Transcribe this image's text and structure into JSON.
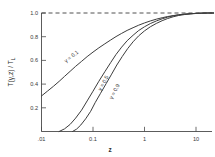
{
  "chart_data": {
    "type": "line",
    "title": "",
    "xlabel": "z",
    "ylabel": "T(γ,z) / T_L",
    "ylabel_main": "T(γ,z) / T",
    "ylabel_sub": "L",
    "xscale": "log",
    "xlim": [
      0.008,
      30
    ],
    "ylim": [
      0.0,
      1.06
    ],
    "grid": false,
    "legend_position": "inline-curve-labels",
    "xticks": [
      0.01,
      0.1,
      1,
      10
    ],
    "xticklabels": [
      ".01",
      "0.1",
      "1",
      "10"
    ],
    "yticks": [
      0.2,
      0.4,
      0.6,
      0.8,
      1.0
    ],
    "yticklabels": [
      "0.2",
      "0.4",
      "0.6",
      "0.8",
      "1.0"
    ],
    "annotations": [
      {
        "text": "γ = 0.1",
        "x": 0.04,
        "y": 0.62,
        "rotation": -38
      },
      {
        "text": "γ = 0.5",
        "x": 0.17,
        "y": 0.4,
        "rotation": -62
      },
      {
        "text": "γ = 0.9",
        "x": 0.28,
        "y": 0.33,
        "rotation": -62
      }
    ],
    "reference_line": {
      "y": 1.0,
      "style": "dashed",
      "label": "1.0 asymptote"
    },
    "series": [
      {
        "name": "γ = 0.1",
        "x": [
          0.01,
          0.013,
          0.017,
          0.022,
          0.028,
          0.036,
          0.046,
          0.06,
          0.077,
          0.1,
          0.13,
          0.17,
          0.22,
          0.28,
          0.36,
          0.46,
          0.6,
          0.77,
          1.0,
          1.3,
          1.7,
          2.2,
          2.8,
          3.6,
          4.6,
          6.0,
          7.7,
          10.0,
          13.0,
          17.0,
          22.0
        ],
        "values": [
          0.3,
          0.34,
          0.381,
          0.423,
          0.465,
          0.508,
          0.55,
          0.592,
          0.632,
          0.67,
          0.706,
          0.74,
          0.772,
          0.801,
          0.828,
          0.853,
          0.876,
          0.897,
          0.916,
          0.933,
          0.948,
          0.96,
          0.97,
          0.978,
          0.985,
          0.99,
          0.994,
          0.997,
          0.999,
          1.0,
          1.0
        ]
      },
      {
        "name": "γ = 0.5",
        "x": [
          0.022,
          0.028,
          0.036,
          0.046,
          0.06,
          0.077,
          0.1,
          0.13,
          0.17,
          0.22,
          0.28,
          0.36,
          0.46,
          0.6,
          0.77,
          1.0,
          1.3,
          1.7,
          2.2,
          2.8,
          3.6,
          4.6,
          6.0,
          7.7,
          10.0,
          13.0,
          17.0,
          22.0
        ],
        "values": [
          0.0,
          0.022,
          0.06,
          0.113,
          0.18,
          0.258,
          0.34,
          0.424,
          0.505,
          0.581,
          0.65,
          0.712,
          0.766,
          0.812,
          0.852,
          0.884,
          0.911,
          0.933,
          0.951,
          0.965,
          0.976,
          0.984,
          0.99,
          0.994,
          0.997,
          0.999,
          1.0,
          1.0
        ]
      },
      {
        "name": "γ = 0.9",
        "x": [
          0.04,
          0.048,
          0.058,
          0.072,
          0.09,
          0.11,
          0.14,
          0.18,
          0.23,
          0.29,
          0.37,
          0.47,
          0.6,
          0.77,
          1.0,
          1.3,
          1.7,
          2.2,
          2.8,
          3.6,
          4.6,
          6.0,
          7.7,
          10.0,
          13.0,
          17.0,
          22.0
        ],
        "values": [
          0.0,
          0.02,
          0.055,
          0.107,
          0.17,
          0.243,
          0.322,
          0.404,
          0.484,
          0.561,
          0.633,
          0.699,
          0.757,
          0.807,
          0.849,
          0.884,
          0.912,
          0.935,
          0.953,
          0.968,
          0.979,
          0.987,
          0.992,
          0.996,
          0.998,
          1.0,
          1.0
        ]
      }
    ]
  }
}
